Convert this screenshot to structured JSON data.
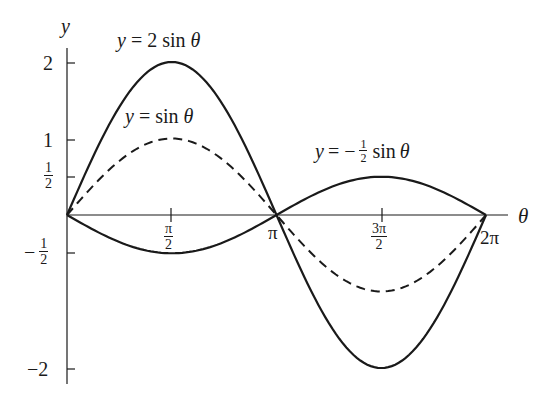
{
  "chart_data": {
    "type": "line",
    "title": "",
    "xlabel": "θ",
    "ylabel": "y",
    "x_range": [
      0,
      6.2832
    ],
    "ylim": [
      -2,
      2
    ],
    "grid": false,
    "legend_position": "inline annotations",
    "x_ticks": [
      {
        "value": 1.5708,
        "label_num": "π",
        "label_den": "2"
      },
      {
        "value": 3.1416,
        "label": "π"
      },
      {
        "value": 4.7124,
        "label_num": "3π",
        "label_den": "2"
      },
      {
        "value": 6.2832,
        "label": "2π"
      }
    ],
    "y_ticks": [
      {
        "value": 2,
        "label": "2"
      },
      {
        "value": 1,
        "label": "1"
      },
      {
        "value": 0.5,
        "label_num": "1",
        "label_den": "2"
      },
      {
        "value": -0.5,
        "label_sign": "−",
        "label_num": "1",
        "label_den": "2"
      },
      {
        "value": -2,
        "label": "−2"
      }
    ],
    "series": [
      {
        "name": "y = 2 sin θ",
        "amplitude": 2,
        "style": "solid",
        "points": [
          [
            0,
            0
          ],
          [
            1.5708,
            2
          ],
          [
            3.1416,
            0
          ],
          [
            4.7124,
            -2
          ],
          [
            6.2832,
            0
          ]
        ]
      },
      {
        "name": "y = sin θ",
        "amplitude": 1,
        "style": "dashed",
        "points": [
          [
            0,
            0
          ],
          [
            1.5708,
            1
          ],
          [
            3.1416,
            0
          ],
          [
            4.7124,
            -1
          ],
          [
            6.2832,
            0
          ]
        ]
      },
      {
        "name": "y = −½ sin θ",
        "amplitude": -0.5,
        "style": "solid",
        "points": [
          [
            0,
            0
          ],
          [
            1.5708,
            -0.5
          ],
          [
            3.1416,
            0
          ],
          [
            4.7124,
            0.5
          ],
          [
            6.2832,
            0
          ]
        ]
      }
    ],
    "annotations": [
      {
        "text": "y = 2 sin θ",
        "near": "peak of 2 sin θ"
      },
      {
        "text": "y = sin θ",
        "near": "peak of sin θ"
      },
      {
        "text": "y = −½ sin θ",
        "near": "peak of −½ sin θ at 3π/2"
      }
    ]
  },
  "labels": {
    "y_axis": "y",
    "x_axis": "θ",
    "ann_2sin_lhs": "y",
    "ann_2sin_rhs": "= 2 sin",
    "ann_2sin_var": "θ",
    "ann_sin_lhs": "y",
    "ann_sin_rhs": "= sin",
    "ann_sin_var": "θ",
    "ann_half_lhs": "y",
    "ann_half_eq": "= −",
    "ann_half_num": "1",
    "ann_half_den": "2",
    "ann_half_rhs": "sin",
    "ann_half_var": "θ",
    "tick_y2": "2",
    "tick_y1": "1",
    "tick_yhalf_num": "1",
    "tick_yhalf_den": "2",
    "tick_ynhalf_sign": "−",
    "tick_ynhalf_num": "1",
    "tick_ynhalf_den": "2",
    "tick_yn2": "−2",
    "tick_x1_num": "π",
    "tick_x1_den": "2",
    "tick_x2": "π",
    "tick_x3_num": "3π",
    "tick_x3_den": "2",
    "tick_x4": "2π"
  },
  "colors": {
    "ink": "#1a1a1a",
    "background": "#ffffff"
  }
}
